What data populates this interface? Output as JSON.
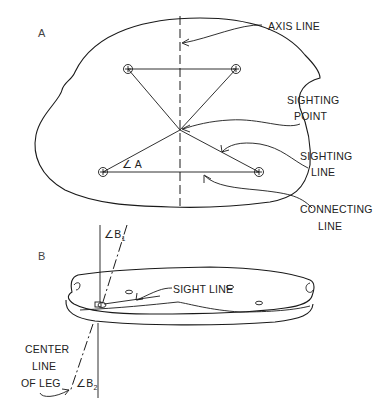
{
  "figure": {
    "panel_a": {
      "label": "A",
      "callouts": {
        "axis_line": "AXIS LINE",
        "sighting_point_1": "SIGHTING",
        "sighting_point_2": "POINT",
        "sighting_line_1": "SIGHTING",
        "sighting_line_2": "LINE",
        "connecting_line_1": "CONNECTING",
        "connecting_line_2": "LINE"
      },
      "angle_label": "∠ A"
    },
    "panel_b": {
      "label": "B",
      "callouts": {
        "sight_line": "SIGHT LINE",
        "center_line_1": "CENTER",
        "center_line_2": "LINE",
        "center_line_3": "OF LEG"
      },
      "angle_b1": "∠B",
      "angle_b1_sub": "1",
      "angle_b2": "∠B",
      "angle_b2_sub": "2"
    }
  }
}
